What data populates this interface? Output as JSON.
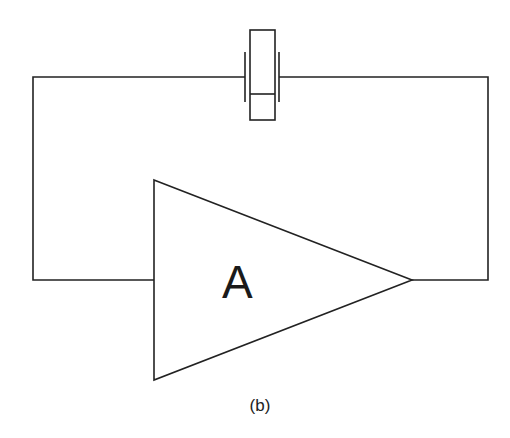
{
  "diagram": {
    "type": "oscillator-circuit",
    "amplifier": {
      "label": "A",
      "shape": "triangle"
    },
    "feedback_element": {
      "type": "crystal-resonator"
    },
    "caption": "(b)",
    "stroke_color": "#222222",
    "background": "#ffffff"
  }
}
